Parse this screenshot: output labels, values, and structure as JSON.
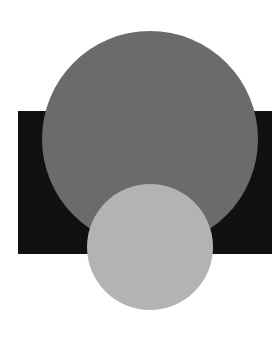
{
  "canvas": {
    "width": 272,
    "height": 339,
    "background": "#ffffff"
  },
  "shapes": {
    "rectangle": {
      "x": 18,
      "y": 111,
      "width": 254,
      "height": 143,
      "color": "#111111"
    },
    "large_circle": {
      "cx": 150,
      "cy": 139,
      "r": 108,
      "color": "#6b6b6b"
    },
    "small_circle": {
      "cx": 150,
      "cy": 247,
      "r": 63,
      "color": "#b3b3b3"
    }
  }
}
